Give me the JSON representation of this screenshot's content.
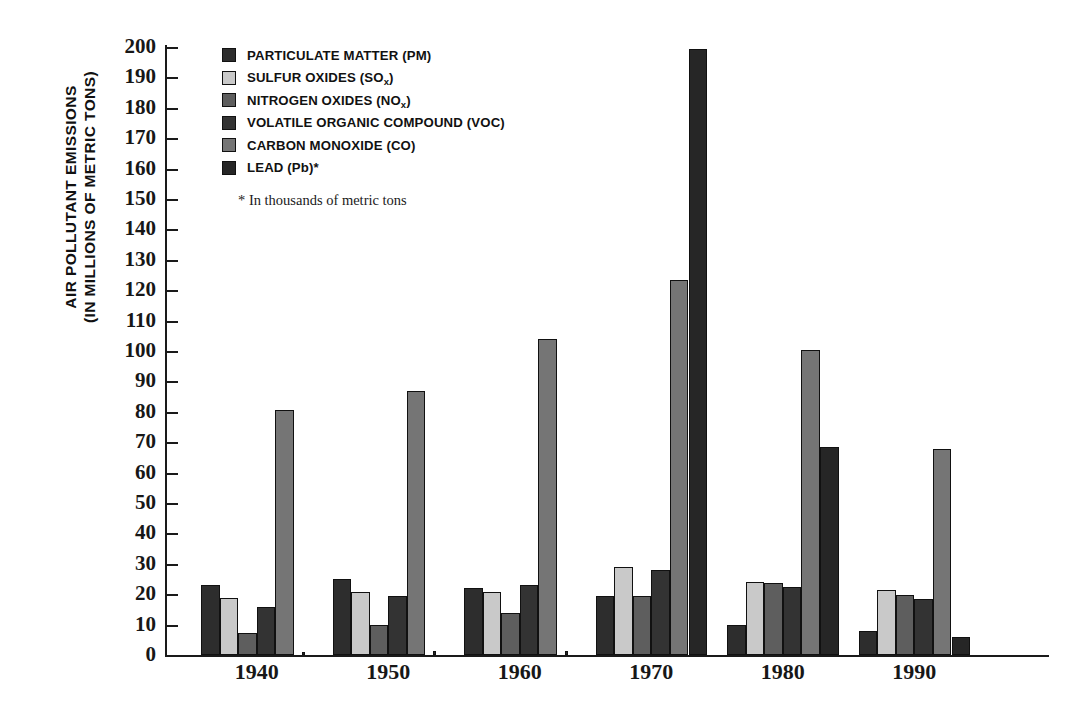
{
  "axis": {
    "y_title_line1": "AIR POLLUTANT EMISSIONS",
    "y_title_line2": "(IN MILLIONS OF METRIC TONS)"
  },
  "legend": {
    "items": [
      {
        "label": "PARTICULATE MATTER (PM)",
        "color": "#2d2d2d",
        "icon": "legend-swatch-pm"
      },
      {
        "label": "SULFUR OXIDES (SO",
        "sub": "x",
        "tail": ")",
        "color": "#c9c9c9",
        "icon": "legend-swatch-sox"
      },
      {
        "label": "NITROGEN OXIDES (NO",
        "sub": "x",
        "tail": ")",
        "color": "#5e5e5e",
        "icon": "legend-swatch-nox"
      },
      {
        "label": "VOLATILE ORGANIC COMPOUND (VOC)",
        "color": "#333333",
        "icon": "legend-swatch-voc"
      },
      {
        "label": "CARBON MONOXIDE (CO)",
        "color": "#757575",
        "icon": "legend-swatch-co"
      },
      {
        "label": "LEAD (Pb)*",
        "color": "#262626",
        "icon": "legend-swatch-pb"
      }
    ],
    "footnote": "* In thousands of metric tons"
  },
  "chart_data": {
    "type": "bar",
    "title": "",
    "xlabel": "",
    "ylabel": "AIR POLLUTANT EMISSIONS (IN MILLIONS OF METRIC TONS)",
    "ylim": [
      0,
      200
    ],
    "ytick_step": 10,
    "yticks": [
      0,
      10,
      20,
      30,
      40,
      50,
      60,
      70,
      80,
      90,
      100,
      110,
      120,
      130,
      140,
      150,
      160,
      170,
      180,
      190,
      200
    ],
    "ytick_labels": [
      "0",
      "10",
      "20",
      "30",
      "40",
      "50",
      "60",
      "70",
      "80",
      "90",
      "100",
      "110",
      "120",
      "130",
      "140",
      "150",
      "160",
      "170",
      "180",
      "190",
      "200"
    ],
    "grid": false,
    "legend_position": "top-left",
    "categories": [
      "1940",
      "1950",
      "1960",
      "1970",
      "1980",
      "1990"
    ],
    "series": [
      {
        "name": "PARTICULATE MATTER (PM)",
        "color": "#2d2d2d",
        "values": [
          23,
          25,
          22,
          19.5,
          9.8,
          8
        ]
      },
      {
        "name": "SULFUR OXIDES (SOx)",
        "color": "#c9c9c9",
        "values": [
          18.7,
          20.8,
          20.8,
          29,
          24,
          21.5
        ]
      },
      {
        "name": "NITROGEN OXIDES (NOx)",
        "color": "#5e5e5e",
        "values": [
          7.4,
          10,
          13.8,
          19.5,
          23.8,
          19.9
        ]
      },
      {
        "name": "VOLATILE ORGANIC COMPOUND (VOC)",
        "color": "#333333",
        "values": [
          15.8,
          19.4,
          23,
          28,
          22.3,
          18.4
        ]
      },
      {
        "name": "CARBON MONOXIDE (CO)",
        "color": "#757575",
        "values": [
          80.5,
          86.8,
          103.8,
          123.5,
          100.4,
          67.8
        ]
      },
      {
        "name": "LEAD (Pb)*",
        "color": "#262626",
        "values": [
          1.0,
          1.2,
          1.4,
          199.5,
          68.5,
          6.0
        ]
      }
    ]
  }
}
